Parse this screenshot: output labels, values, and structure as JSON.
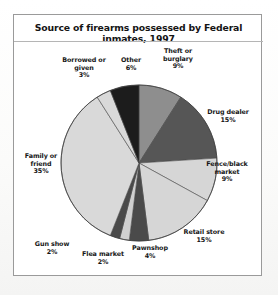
{
  "panel": {
    "title": "Source of firearms possessed by Federal inmates, 1997"
  },
  "chart_data": {
    "type": "pie",
    "title": "Source of firearms possessed by Federal inmates, 1997",
    "xlabel": "",
    "ylabel": "",
    "units": "percent",
    "legend_position": "none",
    "grid": false,
    "start_angle_deg": 0,
    "direction": "clockwise",
    "categories": [
      "Theft or burglary",
      "Drug dealer",
      "Fence/black market",
      "Retail store",
      "Pawnshop",
      "Flea market",
      "Gun show",
      "Family or friend",
      "Borrowed or given",
      "Other"
    ],
    "values": [
      9,
      15,
      9,
      15,
      4,
      2,
      2,
      35,
      3,
      6
    ],
    "value_labels": [
      "9%",
      "15%",
      "9%",
      "15%",
      "4%",
      "2%",
      "2%",
      "35%",
      "3%",
      "6%"
    ],
    "colors": [
      "#8e8e8e",
      "#565656",
      "#d6d6d6",
      "#d6d6d6",
      "#4a4a4a",
      "#d0d0d0",
      "#4a4a4a",
      "#d9d9d9",
      "#d9d9d9",
      "#1c1c1c"
    ],
    "slices": [
      {
        "label": "Theft or burglary",
        "value": 9,
        "pct": "9%",
        "color": "#8e8e8e",
        "line1": "Theft or",
        "line2": "burglary"
      },
      {
        "label": "Drug dealer",
        "value": 15,
        "pct": "15%",
        "color": "#565656",
        "line1": "Drug dealer",
        "line2": ""
      },
      {
        "label": "Fence/black market",
        "value": 9,
        "pct": "9%",
        "color": "#d6d6d6",
        "line1": "Fence/black",
        "line2": "market"
      },
      {
        "label": "Retail store",
        "value": 15,
        "pct": "15%",
        "color": "#d6d6d6",
        "line1": "Retail store",
        "line2": ""
      },
      {
        "label": "Pawnshop",
        "value": 4,
        "pct": "4%",
        "color": "#4a4a4a",
        "line1": "Pawnshop",
        "line2": ""
      },
      {
        "label": "Flea market",
        "value": 2,
        "pct": "2%",
        "color": "#d0d0d0",
        "line1": "Flea market",
        "line2": ""
      },
      {
        "label": "Gun show",
        "value": 2,
        "pct": "2%",
        "color": "#4a4a4a",
        "line1": "Gun show",
        "line2": ""
      },
      {
        "label": "Family or friend",
        "value": 35,
        "pct": "35%",
        "color": "#d9d9d9",
        "line1": "Family or",
        "line2": "friend"
      },
      {
        "label": "Borrowed or given",
        "value": 3,
        "pct": "3%",
        "color": "#d9d9d9",
        "line1": "Borrowed or",
        "line2": "given"
      },
      {
        "label": "Other",
        "value": 6,
        "pct": "6%",
        "color": "#1c1c1c",
        "line1": "Other",
        "line2": ""
      }
    ]
  },
  "labels": {
    "theft": {
      "line1": "Theft or",
      "line2": "burglary",
      "pct": "9%"
    },
    "drug": {
      "line1": "Drug dealer",
      "line2": "",
      "pct": "15%"
    },
    "fence": {
      "line1": "Fence/black",
      "line2": "market",
      "pct": "9%"
    },
    "retail": {
      "line1": "Retail store",
      "line2": "",
      "pct": "15%"
    },
    "pawnshop": {
      "line1": "Pawnshop",
      "line2": "",
      "pct": "4%"
    },
    "flea": {
      "line1": "Flea market",
      "line2": "",
      "pct": "2%"
    },
    "gunshow": {
      "line1": "Gun show",
      "line2": "",
      "pct": "2%"
    },
    "family": {
      "line1": "Family or",
      "line2": "friend",
      "pct": "35%"
    },
    "borrowed": {
      "line1": "Borrowed or",
      "line2": "given",
      "pct": "3%"
    },
    "other": {
      "line1": "Other",
      "line2": "",
      "pct": "6%"
    }
  }
}
